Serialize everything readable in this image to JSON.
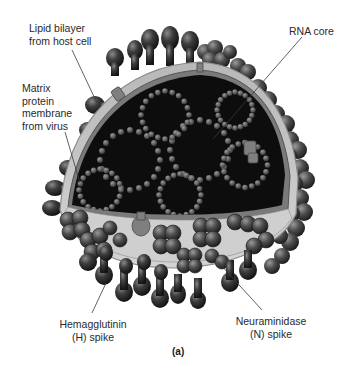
{
  "figure": {
    "caption": "(a)"
  },
  "labels": [
    {
      "id": "lipid-bilayer",
      "text": "Lipid bilayer\nfrom host cell"
    },
    {
      "id": "matrix-protein",
      "text": "Matrix\nprotein\nmembrane\nfrom virus"
    },
    {
      "id": "rna-core",
      "text": "RNA core"
    },
    {
      "id": "hemagglutinin",
      "text": "Hemagglutinin\n(H) spike"
    },
    {
      "id": "neuraminidase",
      "text": "Neuraminidase\n(N) spike"
    }
  ],
  "colors": {
    "spike_dark": "#2b2b2b",
    "spike_mid": "#555555",
    "membrane_outer": "#a9a9a9",
    "membrane_inner": "#6e6e6e",
    "core": "#0d0d0d",
    "rna_bead": "#6a6a6a",
    "leader": "#3a3a3a"
  }
}
